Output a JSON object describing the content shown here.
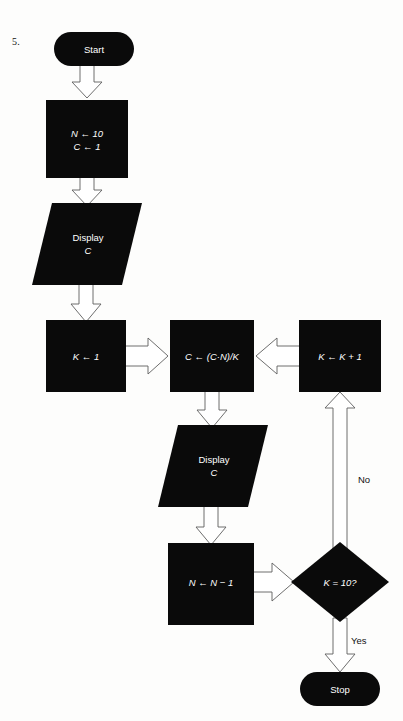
{
  "page": {
    "item_number": "5.",
    "background_color": "#fdfdfc",
    "shape_color": "#0a0a0a",
    "shape_text_color": "#ffffff",
    "arrow_fill_color": "#ffffff",
    "arrow_stroke_color": "#5d5d5d",
    "edge_label_color": "#111111"
  },
  "flowchart": {
    "title": "Flowchart 5",
    "nodes": [
      {
        "id": "start",
        "type": "terminator",
        "label": "Start",
        "x": 54,
        "y": 32,
        "w": 80,
        "h": 34
      },
      {
        "id": "init",
        "type": "process",
        "label_line1": "N ← 10",
        "label_line2": "C ← 1",
        "x": 46,
        "y": 100,
        "w": 82,
        "h": 78
      },
      {
        "id": "display1",
        "type": "inputoutput",
        "label_line1": "Display",
        "label_line2": "C",
        "x": 32,
        "y": 203,
        "w": 110,
        "h": 82
      },
      {
        "id": "k_init",
        "type": "process",
        "label": "K ← 1",
        "x": 46,
        "y": 320,
        "w": 80,
        "h": 72
      },
      {
        "id": "compute",
        "type": "process",
        "label": "C ← (C·N)/K",
        "x": 170,
        "y": 320,
        "w": 84,
        "h": 72
      },
      {
        "id": "k_incr",
        "type": "process",
        "label": "K ← K + 1",
        "x": 299,
        "y": 320,
        "w": 82,
        "h": 72
      },
      {
        "id": "display2",
        "type": "inputoutput",
        "label_line1": "Display",
        "label_line2": "C",
        "x": 158,
        "y": 425,
        "w": 110,
        "h": 82
      },
      {
        "id": "dec_n",
        "type": "process",
        "label": "N ← N − 1",
        "x": 168,
        "y": 543,
        "w": 86,
        "h": 82
      },
      {
        "id": "test",
        "type": "decision",
        "label": "K = 10?",
        "cx": 340,
        "cy": 582,
        "rx": 49,
        "ry": 40
      },
      {
        "id": "stop",
        "type": "terminator",
        "label": "Stop",
        "x": 300,
        "y": 672,
        "w": 80,
        "h": 34
      }
    ],
    "edges": [
      {
        "id": "start-to-init",
        "from": "start",
        "to": "init",
        "direction": "down",
        "label": ""
      },
      {
        "id": "init-to-display1",
        "from": "init",
        "to": "display1",
        "direction": "down",
        "label": ""
      },
      {
        "id": "display1-to-kinit",
        "from": "display1",
        "to": "k_init",
        "direction": "down",
        "label": ""
      },
      {
        "id": "kinit-to-compute",
        "from": "k_init",
        "to": "compute",
        "direction": "right",
        "label": ""
      },
      {
        "id": "kincr-to-compute",
        "from": "k_incr",
        "to": "compute",
        "direction": "left",
        "label": ""
      },
      {
        "id": "compute-to-display2",
        "from": "compute",
        "to": "display2",
        "direction": "down",
        "label": ""
      },
      {
        "id": "display2-to-decn",
        "from": "display2",
        "to": "dec_n",
        "direction": "down",
        "label": ""
      },
      {
        "id": "decn-to-test",
        "from": "dec_n",
        "to": "test",
        "direction": "right",
        "label": ""
      },
      {
        "id": "test-to-kincr",
        "from": "test",
        "to": "k_incr",
        "direction": "up",
        "label": "No"
      },
      {
        "id": "test-to-stop",
        "from": "test",
        "to": "stop",
        "direction": "down",
        "label": "Yes"
      }
    ],
    "edge_labels": {
      "no": "No",
      "yes": "Yes"
    }
  }
}
